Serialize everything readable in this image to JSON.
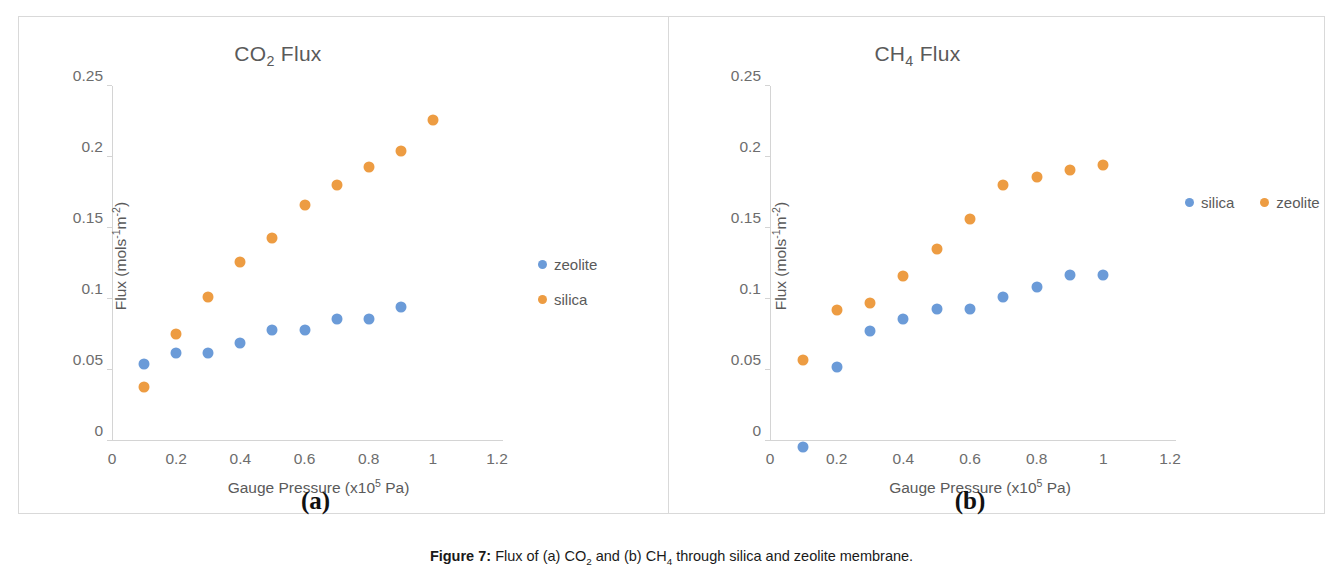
{
  "caption": {
    "label": "Figure 7:",
    "text_1": " Flux of (a) CO",
    "sub_1": "2",
    "text_2": " and (b) CH",
    "sub_2": "4",
    "text_3": " through silica and zeolite membrane."
  },
  "panels": [
    {
      "sub_label": "(a)",
      "title_main": "CO",
      "title_sub": "2",
      "title_tail": " Flux"
    },
    {
      "sub_label": "(b)",
      "title_main": "CH",
      "title_sub": "4",
      "title_tail": " Flux"
    }
  ],
  "axis_text": {
    "x_title_main": "Gauge Pressure (x10",
    "x_title_sup": "5",
    "x_title_tail": " Pa)",
    "y_title_main": "Flux (mols",
    "y_title_sup_1": "-1",
    "y_title_mid": "m",
    "y_title_sup_2": "-2",
    "y_title_tail": ")"
  },
  "colors": {
    "series_blue": "#6b9bd8",
    "series_orange": "#ed9c42",
    "axis": "#d4d4d4",
    "frame": "#d9d9d9",
    "text": "#5a5a5a"
  },
  "chart_data": [
    {
      "type": "scatter",
      "title": "CO2 Flux",
      "xlabel": "Gauge Pressure (x10^5 Pa)",
      "ylabel": "Flux (mols^-1 m^-2)",
      "xlim": [
        0,
        1.2
      ],
      "ylim": [
        0,
        0.25
      ],
      "xticks": [
        "0",
        "0.2",
        "0.4",
        "0.6",
        "0.8",
        "1",
        "1.2"
      ],
      "xtick_values": [
        0,
        0.2,
        0.4,
        0.6,
        0.8,
        1,
        1.2
      ],
      "yticks": [
        "0",
        "0.05",
        "0.1",
        "0.15",
        "0.2",
        "0.25"
      ],
      "ytick_values": [
        0,
        0.05,
        0.1,
        0.15,
        0.2,
        0.25
      ],
      "grid": false,
      "legend_position": "right",
      "series": [
        {
          "name": "zeolite",
          "color": "#6b9bd8",
          "x": [
            0.1,
            0.2,
            0.3,
            0.4,
            0.5,
            0.6,
            0.7,
            0.8,
            0.9
          ],
          "values": [
            0.058,
            0.066,
            0.066,
            0.073,
            0.082,
            0.082,
            0.09,
            0.09,
            0.098
          ]
        },
        {
          "name": "silica",
          "color": "#ed9c42",
          "x": [
            0.1,
            0.2,
            0.3,
            0.4,
            0.5,
            0.6,
            0.7,
            0.8,
            0.9,
            1.0
          ],
          "values": [
            0.042,
            0.079,
            0.105,
            0.13,
            0.147,
            0.17,
            0.184,
            0.197,
            0.208,
            0.23
          ]
        }
      ]
    },
    {
      "type": "scatter",
      "title": "CH4 Flux",
      "xlabel": "Gauge Pressure (x10^5 Pa)",
      "ylabel": "Flux (mols^-1 m^-2)",
      "xlim": [
        0,
        1.2
      ],
      "ylim": [
        0,
        0.25
      ],
      "xticks": [
        "0",
        "0.2",
        "0.4",
        "0.6",
        "0.8",
        "1",
        "1.2"
      ],
      "xtick_values": [
        0,
        0.2,
        0.4,
        0.6,
        0.8,
        1,
        1.2
      ],
      "yticks": [
        "0",
        "0.05",
        "0.1",
        "0.15",
        "0.2",
        "0.25"
      ],
      "ytick_values": [
        0,
        0.05,
        0.1,
        0.15,
        0.2,
        0.25
      ],
      "grid": false,
      "legend_position": "right",
      "series": [
        {
          "name": "silica",
          "color": "#6b9bd8",
          "x": [
            0.1,
            0.2,
            0.3,
            0.4,
            0.5,
            0.6,
            0.7,
            0.8,
            0.9,
            1.0
          ],
          "values": [
            0.0,
            0.056,
            0.081,
            0.09,
            0.097,
            0.097,
            0.105,
            0.112,
            0.121,
            0.121
          ]
        },
        {
          "name": "zeolite",
          "color": "#ed9c42",
          "x": [
            0.1,
            0.2,
            0.3,
            0.4,
            0.5,
            0.6,
            0.7,
            0.8,
            0.9,
            1.0
          ],
          "values": [
            0.061,
            0.096,
            0.101,
            0.12,
            0.139,
            0.16,
            0.184,
            0.19,
            0.195,
            0.198
          ]
        }
      ]
    }
  ],
  "legends": [
    {
      "orientation": "vertical",
      "entries": [
        {
          "label": "zeolite",
          "color_class": "series-0"
        },
        {
          "label": "silica",
          "color_class": "series-1"
        }
      ]
    },
    {
      "orientation": "horizontal",
      "entries": [
        {
          "label": "silica",
          "color_class": "series-0"
        },
        {
          "label": "zeolite",
          "color_class": "series-1"
        }
      ]
    }
  ]
}
